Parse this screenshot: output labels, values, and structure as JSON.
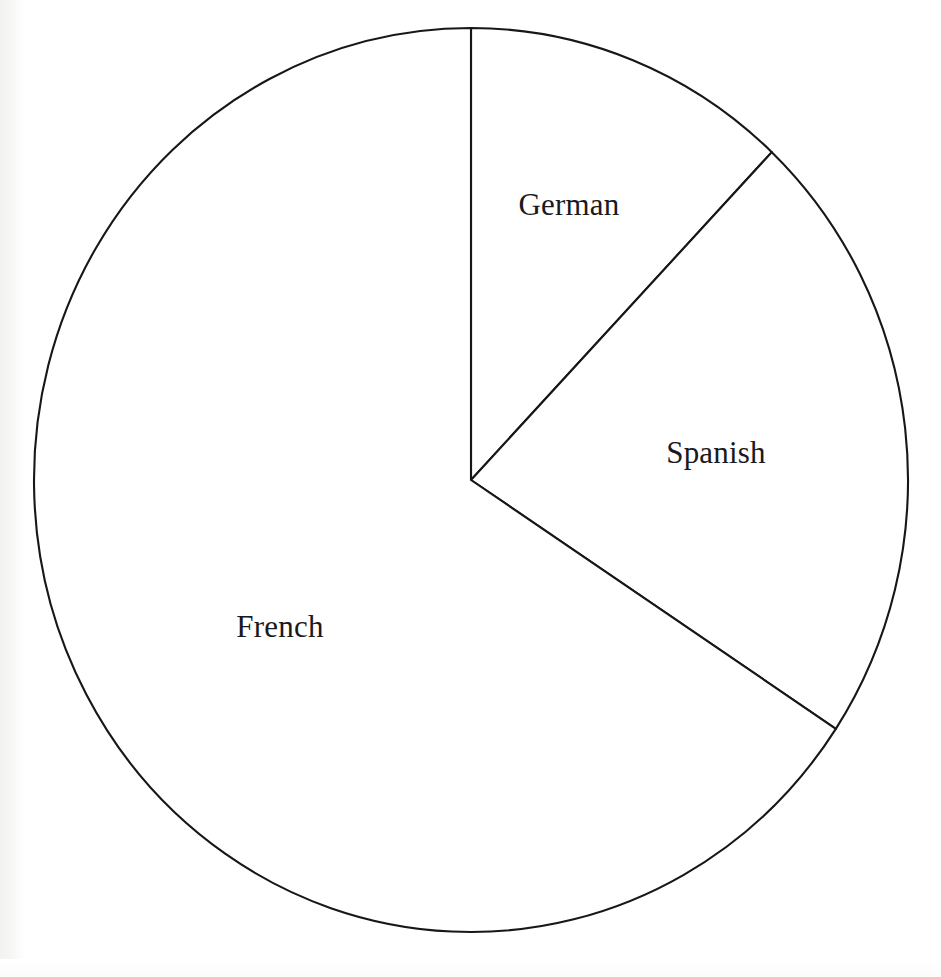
{
  "chart_data": {
    "type": "pie",
    "title": "",
    "subtitle": "",
    "xlabel": "",
    "ylabel": "",
    "legend_position": "none",
    "grid": false,
    "start_angle_deg": 0,
    "direction": "clockwise",
    "categories": [
      "German",
      "Spanish",
      "French"
    ],
    "values": [
      12,
      22,
      66
    ],
    "unit": "percent",
    "slices": [
      {
        "label": "German",
        "value": 12,
        "percent": 12,
        "start_angle_deg": 0,
        "end_angle_deg": 43.5,
        "sweep_deg": 43.5,
        "fill": "#ffffff",
        "stroke": "#17171a",
        "label_x": 569,
        "label_y": 208
      },
      {
        "label": "Spanish",
        "value": 22,
        "percent": 22,
        "start_angle_deg": 43.5,
        "end_angle_deg": 123.4,
        "sweep_deg": 79.9,
        "fill": "#ffffff",
        "stroke": "#17171a",
        "label_x": 716,
        "label_y": 456
      },
      {
        "label": "French",
        "value": 66,
        "percent": 66,
        "start_angle_deg": 123.4,
        "end_angle_deg": 360,
        "sweep_deg": 236.6,
        "fill": "#ffffff",
        "stroke": "#17171a",
        "label_x": 280,
        "label_y": 630
      }
    ],
    "geometry": {
      "center_x": 471,
      "center_y": 480,
      "radius_x": 437,
      "radius_y": 452
    },
    "colors": {
      "background": "#ffffff",
      "outline": "#17171a",
      "slice_fill": "#ffffff",
      "label_text": "#1a1a1d"
    }
  }
}
